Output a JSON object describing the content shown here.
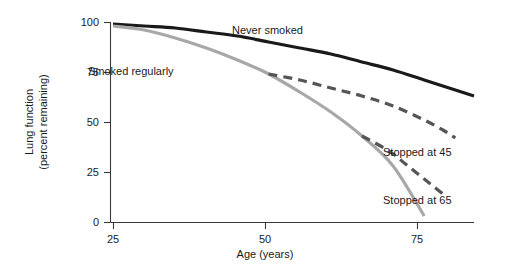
{
  "chart_data": {
    "type": "line",
    "title": "",
    "xlabel": "Age (years)",
    "ylabel_line1": "Lung function",
    "ylabel_line2": "(percent remaining)",
    "xlim": [
      25,
      83
    ],
    "ylim": [
      0,
      100
    ],
    "xticks": [
      25,
      50,
      75
    ],
    "xtick_labels": [
      "25",
      "50",
      "75"
    ],
    "yticks": [
      0,
      25,
      50,
      75,
      100
    ],
    "ytick_labels": [
      "0",
      "25",
      "50",
      "75",
      "100"
    ],
    "grid": false,
    "legend": "inline-annotations",
    "series": [
      {
        "name": "Never smoked",
        "label": "Never smoked",
        "style": "solid",
        "color": "#1a1a1a",
        "width": 3.2,
        "x": [
          25,
          30,
          35,
          40,
          45,
          50,
          55,
          60,
          65,
          70,
          75,
          80,
          83
        ],
        "values": [
          99,
          98,
          97,
          95,
          93,
          90,
          87,
          84,
          80,
          76,
          71,
          66,
          63
        ]
      },
      {
        "name": "Smoked regularly",
        "label": "Smoked regularly",
        "style": "solid",
        "color": "#a8a8a8",
        "width": 3.2,
        "x": [
          25,
          30,
          35,
          40,
          45,
          50,
          55,
          60,
          65,
          70,
          75
        ],
        "values": [
          98,
          96,
          92,
          87,
          81,
          74,
          65,
          55,
          43,
          28,
          3
        ]
      },
      {
        "name": "Stopped at 45",
        "label": "Stopped at 45",
        "style": "dashed",
        "color": "#555555",
        "width": 3.2,
        "x": [
          50,
          55,
          60,
          65,
          70,
          75,
          78,
          80
        ],
        "values": [
          74,
          71,
          67,
          63,
          58,
          51,
          46,
          42
        ]
      },
      {
        "name": "Stopped at 65",
        "label": "Stopped at 65",
        "style": "dashed",
        "color": "#555555",
        "width": 3.2,
        "x": [
          65,
          68,
          70,
          72,
          74,
          76,
          78
        ],
        "values": [
          43,
          38,
          34,
          29,
          24,
          19,
          14
        ]
      }
    ],
    "annotations": [
      {
        "text": "Never smoked",
        "x_px": 232,
        "y_px": 34
      },
      {
        "text": "Smoked regularly",
        "x_px": 88,
        "y_px": 75
      },
      {
        "text": "Stopped at 45",
        "x_px": 383,
        "y_px": 156
      },
      {
        "text": "Stopped at 65",
        "x_px": 383,
        "y_px": 204
      }
    ]
  },
  "colors": {
    "never_smoked": "#1a1a1a",
    "smoked_regularly": "#a8a8a8",
    "stopped": "#555555",
    "axis": "#3a3a3a",
    "background": "#ffffff"
  }
}
